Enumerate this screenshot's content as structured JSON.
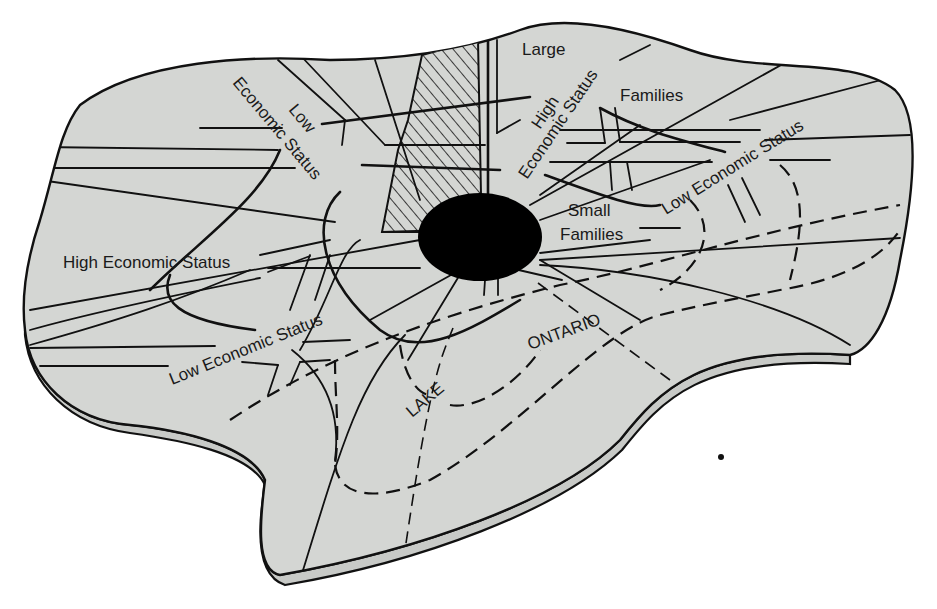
{
  "figure": {
    "colors": {
      "land": "#d4d6d3",
      "ink": "#111111",
      "background": "#ffffff",
      "cbd": "#000000"
    },
    "labels": {
      "large_families_1": "Large",
      "large_families_2": "Families",
      "high_status_ne_1": "High",
      "high_status_ne_2": "Economic Status",
      "low_status_nw_1": "Low",
      "low_status_nw_2": "Economic Status",
      "small_families_1": "Small",
      "small_families_2": "Families",
      "low_status_e": "Low Economic Status",
      "high_status_w": "High Economic Status",
      "low_status_sw": "Low Economic Status",
      "lake_1": "LAKE",
      "lake_2": "ONTARIO"
    },
    "legend_features": {
      "cbd": "central-business-district",
      "hatched_sector": "hatched-sector",
      "dashed_lines": "boundary-lines"
    }
  }
}
